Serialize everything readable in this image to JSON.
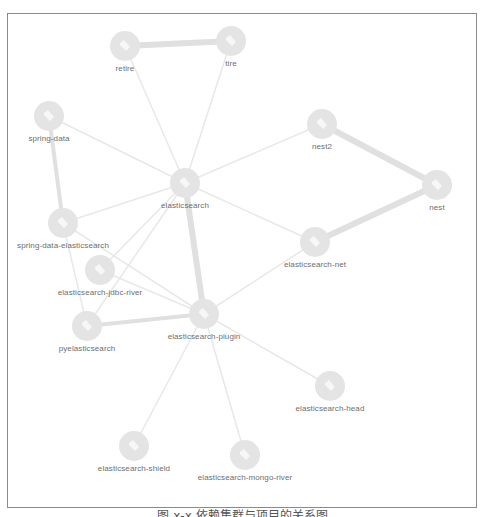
{
  "figure": {
    "caption": "图 x-x 依赖集群与项目的关系图"
  },
  "colors": {
    "node_fill": "#e4e4e4",
    "node_icon": "#f7f7f7",
    "edge": "#e8e8e8",
    "edge_strong": "#e0e0e0",
    "label": "#6e6e6e",
    "frame": "#8a8a8a"
  },
  "nodes": [
    {
      "id": "retire",
      "label": "retire",
      "x": 125,
      "y": 46,
      "r": 15
    },
    {
      "id": "tire",
      "label": "tire",
      "x": 231,
      "y": 41,
      "r": 15
    },
    {
      "id": "spring-data",
      "label": "spring-data",
      "x": 49,
      "y": 116,
      "r": 15
    },
    {
      "id": "nest2",
      "label": "nest2",
      "x": 322,
      "y": 124,
      "r": 15
    },
    {
      "id": "elasticsearch",
      "label": "elasticsearch",
      "x": 185,
      "y": 183,
      "r": 15
    },
    {
      "id": "nest",
      "label": "nest",
      "x": 437,
      "y": 185,
      "r": 15
    },
    {
      "id": "spring-data-elasticsearch",
      "label": "spring-data-elasticsearch",
      "x": 63,
      "y": 223,
      "r": 15
    },
    {
      "id": "elasticsearch-net",
      "label": "elasticsearch-net",
      "x": 315,
      "y": 242,
      "r": 15
    },
    {
      "id": "elasticsearch-jdbc-river",
      "label": "elasticsearch-jdbc-river",
      "x": 100,
      "y": 270,
      "r": 15
    },
    {
      "id": "elasticsearch-plugin",
      "label": "elasticsearch-plugin",
      "x": 204,
      "y": 314,
      "r": 15
    },
    {
      "id": "pyelasticsearch",
      "label": "pyelasticsearch",
      "x": 87,
      "y": 326,
      "r": 15
    },
    {
      "id": "elasticsearch-head",
      "label": "elasticsearch-head",
      "x": 330,
      "y": 386,
      "r": 15
    },
    {
      "id": "elasticsearch-shield",
      "label": "elasticsearch-shield",
      "x": 134,
      "y": 446,
      "r": 15
    },
    {
      "id": "elasticsearch-mongo-river",
      "label": "elasticsearch-mongo-river",
      "x": 245,
      "y": 455,
      "r": 15
    }
  ],
  "edges": [
    {
      "from": "retire",
      "to": "tire",
      "weight": 6
    },
    {
      "from": "retire",
      "to": "elasticsearch",
      "weight": 1.5
    },
    {
      "from": "tire",
      "to": "elasticsearch",
      "weight": 1.5
    },
    {
      "from": "spring-data",
      "to": "elasticsearch",
      "weight": 1.5
    },
    {
      "from": "spring-data",
      "to": "spring-data-elasticsearch",
      "weight": 4
    },
    {
      "from": "nest2",
      "to": "elasticsearch",
      "weight": 1.5
    },
    {
      "from": "nest2",
      "to": "nest",
      "weight": 6
    },
    {
      "from": "nest",
      "to": "elasticsearch-net",
      "weight": 6
    },
    {
      "from": "elasticsearch",
      "to": "elasticsearch-net",
      "weight": 1.5
    },
    {
      "from": "elasticsearch",
      "to": "spring-data-elasticsearch",
      "weight": 1.5
    },
    {
      "from": "elasticsearch",
      "to": "elasticsearch-jdbc-river",
      "weight": 1.5
    },
    {
      "from": "elasticsearch",
      "to": "pyelasticsearch",
      "weight": 1.5
    },
    {
      "from": "elasticsearch",
      "to": "elasticsearch-plugin",
      "weight": 6
    },
    {
      "from": "spring-data-elasticsearch",
      "to": "elasticsearch-plugin",
      "weight": 1.5
    },
    {
      "from": "spring-data-elasticsearch",
      "to": "pyelasticsearch",
      "weight": 1.5
    },
    {
      "from": "elasticsearch-jdbc-river",
      "to": "elasticsearch-plugin",
      "weight": 1.5
    },
    {
      "from": "pyelasticsearch",
      "to": "elasticsearch-plugin",
      "weight": 4
    },
    {
      "from": "elasticsearch-net",
      "to": "elasticsearch-plugin",
      "weight": 1.5
    },
    {
      "from": "elasticsearch-plugin",
      "to": "elasticsearch-head",
      "weight": 1.5
    },
    {
      "from": "elasticsearch-plugin",
      "to": "elasticsearch-shield",
      "weight": 1.5
    },
    {
      "from": "elasticsearch-plugin",
      "to": "elasticsearch-mongo-river",
      "weight": 1.5
    }
  ]
}
